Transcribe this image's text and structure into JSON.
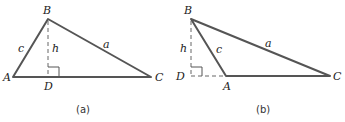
{
  "figures": [
    {
      "id": "a",
      "caption": "(a)",
      "vertices": {
        "A": {
          "label": "A",
          "x": 13,
          "y": 77
        },
        "B": {
          "label": "B",
          "x": 48,
          "y": 19
        },
        "C": {
          "label": "C",
          "x": 151,
          "y": 77
        },
        "D": {
          "label": "D",
          "x": 48,
          "y": 77
        }
      },
      "sides": {
        "a": "a",
        "c": "c",
        "h": "h"
      },
      "note": "altitude h from B meets AC at D inside the triangle; right angle at D"
    },
    {
      "id": "b",
      "caption": "(b)",
      "vertices": {
        "A": {
          "label": "A",
          "x": 226,
          "y": 76
        },
        "B": {
          "label": "B",
          "x": 191,
          "y": 19
        },
        "C": {
          "label": "C",
          "x": 330,
          "y": 76
        },
        "D": {
          "label": "D",
          "x": 191,
          "y": 76
        }
      },
      "sides": {
        "a": "a",
        "c": "c",
        "h": "h"
      },
      "note": "altitude h from B meets extension of CA at D outside the triangle; right angle at D"
    }
  ],
  "colors": {
    "line": "#555555",
    "text": "#222222",
    "background": "#ffffff"
  }
}
